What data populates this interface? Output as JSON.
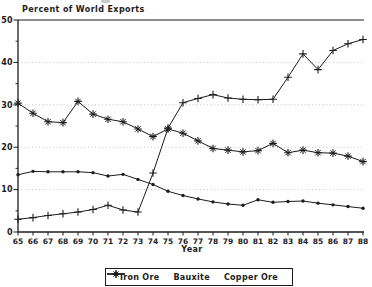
{
  "title": "Percent of World Exports",
  "xlabel": "Year",
  "colors": {
    "line": "#1c1c1c",
    "grid": "#aaaaaa",
    "background": "#ffffff"
  },
  "legend": {
    "items": [
      {
        "label": "Iron Ore",
        "marker": "dot"
      },
      {
        "label": "Bauxite",
        "marker": "plus"
      },
      {
        "label": "Copper Ore",
        "marker": "asterisk"
      }
    ]
  },
  "chart_data": {
    "type": "line",
    "title": "Percent of World Exports",
    "xlabel": "Year",
    "ylabel": "Percent of World Exports",
    "x": [
      65,
      66,
      67,
      68,
      69,
      70,
      71,
      72,
      73,
      74,
      75,
      76,
      77,
      78,
      79,
      80,
      81,
      82,
      83,
      84,
      85,
      86,
      87,
      88
    ],
    "x_tick_labels": [
      "65",
      "66",
      "67",
      "68",
      "69",
      "70",
      "71",
      "72",
      "73",
      "74",
      "75",
      "76",
      "77",
      "78",
      "79",
      "80",
      "81",
      "82",
      "83",
      "84",
      "85",
      "86",
      "87",
      "88"
    ],
    "ylim": [
      0,
      50
    ],
    "yticks": [
      0,
      10,
      20,
      30,
      40,
      50
    ],
    "y_minor_ticks": [
      5,
      15,
      25,
      35,
      45
    ],
    "grid": "horizontal-dotted",
    "legend_position": "bottom",
    "series": [
      {
        "name": "Iron Ore",
        "marker": "dot",
        "values": [
          13.5,
          14.3,
          14.2,
          14.2,
          14.2,
          14.0,
          13.2,
          13.6,
          12.4,
          11.2,
          9.6,
          8.6,
          7.8,
          7.1,
          6.6,
          6.3,
          7.6,
          7.0,
          7.2,
          7.3,
          6.8,
          6.4,
          6.0,
          5.6
        ]
      },
      {
        "name": "Bauxite",
        "marker": "plus",
        "values": [
          3.0,
          3.4,
          3.9,
          4.3,
          4.7,
          5.3,
          6.3,
          5.2,
          4.7,
          13.9,
          24.5,
          30.5,
          31.5,
          32.4,
          31.6,
          31.3,
          31.2,
          31.3,
          36.5,
          42.0,
          38.3,
          42.8,
          44.4,
          45.4
        ]
      },
      {
        "name": "Copper Ore",
        "marker": "asterisk",
        "values": [
          30.4,
          28.0,
          26.0,
          25.8,
          30.8,
          27.8,
          26.6,
          26.0,
          24.3,
          22.5,
          24.3,
          23.3,
          21.5,
          19.7,
          19.3,
          18.9,
          19.2,
          20.9,
          18.7,
          19.3,
          18.7,
          18.6,
          17.9,
          16.6
        ]
      }
    ]
  }
}
